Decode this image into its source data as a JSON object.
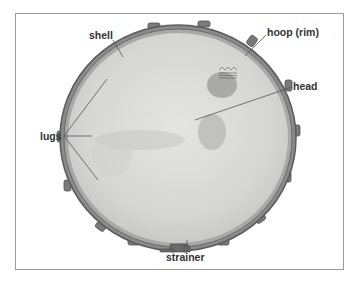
{
  "figure": {
    "colors": {
      "frame_border": "#9a9a9a",
      "label_text": "#333333",
      "leader_line": "#555555",
      "head_fill": "#d9d9d6",
      "hoop": "#6e6e6e"
    },
    "labels": [
      {
        "id": "shell",
        "text": "shell"
      },
      {
        "id": "hoop",
        "text": "hoop (rim)"
      },
      {
        "id": "head",
        "text": "head"
      },
      {
        "id": "lugs",
        "text": "lugs"
      },
      {
        "id": "strainer",
        "text": "strainer"
      }
    ]
  }
}
